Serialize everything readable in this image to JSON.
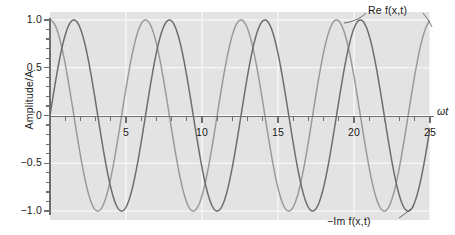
{
  "figure": {
    "background_color": "#ffffff",
    "plot_background_color": "#e3e3e3",
    "gridline_color": "#fdfdfd",
    "axis_color": "#6e6e6e"
  },
  "axes": {
    "y_title": "Amplitude/A",
    "x_title": "ωt"
  },
  "annotations": {
    "re_label": "Re f(x,t)",
    "im_label": "−Im f(x,t)"
  },
  "chart_data": {
    "type": "line",
    "title": "",
    "xlabel": "ωt",
    "ylabel": "Amplitude/A",
    "xlim": [
      0,
      25
    ],
    "ylim": [
      -1.0,
      1.0
    ],
    "grid": true,
    "legend_position": "annotated-on-curve",
    "x_ticks_major": [
      5,
      10,
      15,
      20,
      25
    ],
    "x_tick_labels": [
      "5",
      "10",
      "15",
      "20",
      "25"
    ],
    "x_ticks_minor": [
      1,
      2,
      3,
      4,
      6,
      7,
      8,
      9,
      11,
      12,
      13,
      14,
      16,
      17,
      18,
      19,
      21,
      22,
      23,
      24
    ],
    "y_ticks_major": [
      1.0,
      0.5,
      0,
      -0.5,
      -1.0
    ],
    "y_tick_labels": [
      "1.0",
      "0.5",
      "0",
      "−0.5",
      "−1.0"
    ],
    "y_ticks_minor": [
      0.9,
      0.8,
      0.7,
      0.6,
      0.4,
      0.3,
      0.2,
      0.1,
      -0.1,
      -0.2,
      -0.3,
      -0.4,
      -0.6,
      -0.7,
      -0.8,
      -0.9
    ],
    "series": [
      {
        "name": "Re f(x,t)",
        "color": "#9a9a9a",
        "linewidth": 1.4,
        "formula": "cos(x)",
        "period": 6.283,
        "amplitude": 1.0,
        "phase_deg": 0,
        "peaks_at": [
          0,
          6.28,
          12.57,
          18.85,
          25.13
        ],
        "troughs_at": [
          3.14,
          9.42,
          15.71,
          21.99
        ]
      },
      {
        "name": "−Im f(x,t)",
        "color": "#6d6d6d",
        "linewidth": 1.4,
        "formula": "cos(x − π/2) = sin(x)",
        "period": 6.283,
        "amplitude": 1.0,
        "phase_deg": -90,
        "peaks_at": [
          1.57,
          7.85,
          14.14,
          20.42
        ],
        "troughs_at": [
          4.71,
          10.99,
          17.28,
          23.56
        ]
      }
    ]
  }
}
